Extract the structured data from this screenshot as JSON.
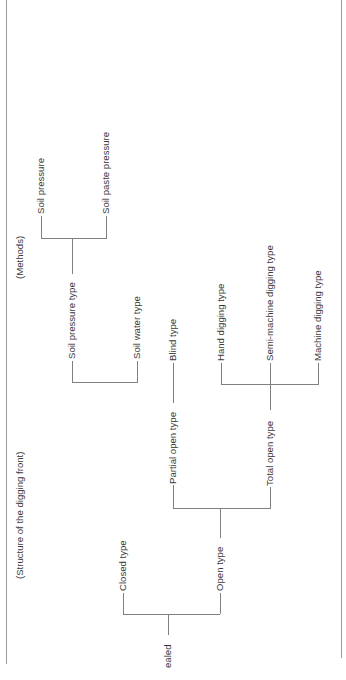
{
  "diagram": {
    "type": "tree",
    "orientation": "rotated-90-ccw",
    "headers": {
      "methods": "(Methods)",
      "structure": "(Structure of the digging front)"
    },
    "nodes": {
      "root": "ealed",
      "closed": "Closed type",
      "open": "Open type",
      "partial_open": "Partial open type",
      "total_open": "Total open type",
      "blind": "Blind type",
      "hand": "Hand digging type",
      "semi_machine": "Semi-machine digging type",
      "machine": "Machine digging type",
      "soil_pressure_type": "Soil pressure type",
      "soil_water_type": "Soil water type",
      "soil_pressure": "Soil pressure",
      "soil_paste_pressure": "Soil paste pressure"
    },
    "edges": [
      [
        "root",
        "closed"
      ],
      [
        "root",
        "open"
      ],
      [
        "open",
        "partial_open"
      ],
      [
        "open",
        "total_open"
      ],
      [
        "partial_open",
        "blind"
      ],
      [
        "total_open",
        "hand"
      ],
      [
        "total_open",
        "semi_machine"
      ],
      [
        "total_open",
        "machine"
      ],
      [
        "soil_pressure_type",
        "soil_pressure"
      ],
      [
        "soil_pressure_type",
        "soil_paste_pressure"
      ]
    ],
    "colors": {
      "line": "#808080",
      "text": "#3a3a3a",
      "border": "#9a9a9a",
      "background": "#ffffff"
    }
  }
}
